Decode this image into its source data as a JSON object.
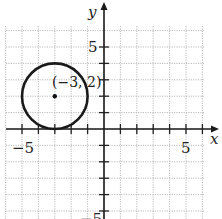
{
  "chart_data": {
    "type": "scatter",
    "title": "",
    "xlabel": "x",
    "ylabel": "y",
    "xlim": [
      -6,
      7
    ],
    "ylim": [
      -6,
      7
    ],
    "grid": true,
    "x_tick_labels": [
      "-5",
      "5"
    ],
    "y_tick_labels": [
      "5",
      "-5"
    ],
    "shapes": [
      {
        "type": "circle",
        "center": [
          -3,
          2
        ],
        "radius": 2
      }
    ],
    "points": [
      {
        "x": -3,
        "y": 2,
        "label": "(−3, 2)"
      }
    ]
  },
  "labels": {
    "x_axis": "x",
    "y_axis": "y",
    "x_neg5": "−5",
    "x_pos5": "5",
    "y_pos5": "5",
    "y_neg5": "−5",
    "center_point": "(−3, 2)"
  }
}
